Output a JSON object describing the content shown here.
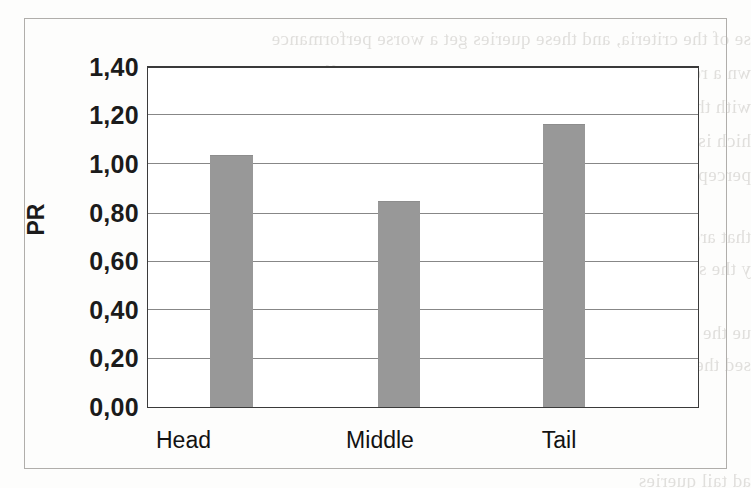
{
  "figure": {
    "background_color": "#fdfdfc",
    "frame_color": "#b0aeab",
    "bar_color": "#989898",
    "gridline_color": "#878787",
    "axis_color": "#3a3a3a"
  },
  "chart_data": {
    "type": "bar",
    "title": "",
    "xlabel": "",
    "ylabel": "PR",
    "categories": [
      "Head",
      "Middle",
      "Tail"
    ],
    "values": [
      1.04,
      0.85,
      1.17
    ],
    "ylim": [
      0.0,
      1.4
    ],
    "ytick_values": [
      0.0,
      0.2,
      0.4,
      0.6,
      0.8,
      1.0,
      1.2,
      1.4
    ],
    "ytick_labels": [
      "0,00",
      "0,20",
      "0,40",
      "0,60",
      "0,80",
      "1,00",
      "1,20",
      "1,40"
    ],
    "decimal_separator": ",",
    "grid": true,
    "grid_axis": "y",
    "legend": false,
    "legend_position": "none",
    "series": [
      {
        "name": "PR",
        "values": [
          1.04,
          0.85,
          1.17
        ],
        "color": "#989898"
      }
    ]
  },
  "axes": {
    "y_title": "PR",
    "y_ticks": [
      {
        "label": "1,40",
        "value": 1.4
      },
      {
        "label": "1,20",
        "value": 1.2
      },
      {
        "label": "1,00",
        "value": 1.0
      },
      {
        "label": "0,80",
        "value": 0.8
      },
      {
        "label": "0,60",
        "value": 0.6
      },
      {
        "label": "0,40",
        "value": 0.4
      },
      {
        "label": "0,20",
        "value": 0.2
      },
      {
        "label": "0,00",
        "value": 0.0
      }
    ],
    "x_ticks": [
      {
        "label": "Head"
      },
      {
        "label": "Middle"
      },
      {
        "label": "Tail"
      }
    ]
  },
  "scan_bleed": {
    "note": "faint mirrored show-through text from the reverse side of the scanned page",
    "lines": [
      "se of the criteria, and these queries get a worse performance",
      "wn a reduction in both in the crossing query. The differences be",
      "with the different aspects. The interesting difference is given by",
      "hich is consistently larger than the variance obtained in the prev",
      "perceptible variability (4) in the table of related changes in flow",
      "",
      "that are employed by the users. It is very important to observe",
      "y the system is not very different from the results that are users",
      "",
      "ue the reason over the behaviour of the long tail queries",
      "sed the aspects and the relevance judgments are not useful",
      "ad tail queries"
    ]
  }
}
